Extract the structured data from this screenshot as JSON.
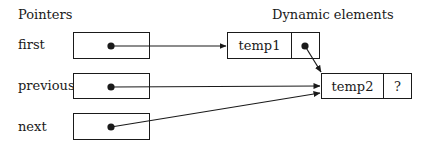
{
  "headers": {
    "pointers": "Pointers",
    "dynamic": "Dynamic elements"
  },
  "pointers": [
    {
      "name": "first",
      "points_to": "temp1"
    },
    {
      "name": "previous",
      "points_to": "temp2"
    },
    {
      "name": "next",
      "points_to": "temp2"
    }
  ],
  "elements": [
    {
      "value": "temp1",
      "link": "•",
      "link_target": "temp2"
    },
    {
      "value": "temp2",
      "link": "?"
    }
  ],
  "colors": {
    "stroke": "#1a1a1a",
    "background": "#ffffff"
  }
}
